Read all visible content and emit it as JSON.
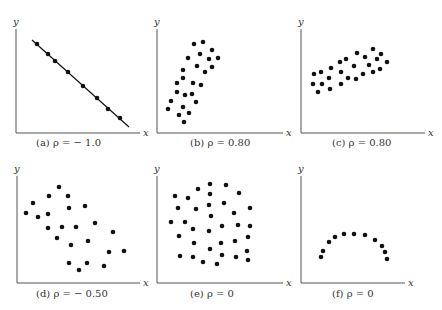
{
  "chart_data": [
    {
      "id": "a",
      "type": "scatter",
      "caption": "(a)   ρ = − 1.0",
      "xlabel": "x",
      "ylabel": "y",
      "rho": -1.0,
      "fit_line": true,
      "axes": {
        "ox": 16,
        "oy": 133,
        "ytop": 29,
        "xend": 140
      },
      "line": [
        32,
        40,
        129,
        127
      ],
      "points": [
        [
          37,
          44
        ],
        [
          48,
          54
        ],
        [
          55,
          61
        ],
        [
          68,
          72
        ],
        [
          83,
          86
        ],
        [
          97,
          98
        ],
        [
          108,
          109
        ],
        [
          120,
          118
        ]
      ],
      "caption_pos": [
        36,
        146
      ]
    },
    {
      "id": "b",
      "type": "scatter",
      "caption": "(b)   ρ = 0.80",
      "xlabel": "x",
      "ylabel": "y",
      "rho": 0.8,
      "fit_line": false,
      "axes": {
        "ox": 157,
        "oy": 133,
        "ytop": 29,
        "xend": 283
      },
      "points": [
        [
          194,
          44
        ],
        [
          203,
          42
        ],
        [
          212,
          50
        ],
        [
          200,
          54
        ],
        [
          188,
          58
        ],
        [
          209,
          59
        ],
        [
          218,
          58
        ],
        [
          212,
          67
        ],
        [
          197,
          66
        ],
        [
          183,
          70
        ],
        [
          205,
          72
        ],
        [
          183,
          78
        ],
        [
          177,
          83
        ],
        [
          193,
          83
        ],
        [
          201,
          85
        ],
        [
          177,
          92
        ],
        [
          185,
          95
        ],
        [
          192,
          94
        ],
        [
          171,
          101
        ],
        [
          196,
          102
        ],
        [
          183,
          107
        ],
        [
          168,
          109
        ],
        [
          189,
          113
        ],
        [
          179,
          115
        ],
        [
          184,
          122
        ]
      ],
      "caption_pos": [
        190,
        146
      ]
    },
    {
      "id": "c",
      "type": "scatter",
      "caption": "(c)   ρ = 0.80",
      "xlabel": "x",
      "ylabel": "y",
      "rho": 0.8,
      "fit_line": false,
      "axes": {
        "ox": 301,
        "oy": 133,
        "ytop": 29,
        "xend": 425
      },
      "points": [
        [
          373,
          49
        ],
        [
          381,
          54
        ],
        [
          357,
          53
        ],
        [
          365,
          57
        ],
        [
          377,
          59
        ],
        [
          387,
          62
        ],
        [
          346,
          59
        ],
        [
          340,
          62
        ],
        [
          354,
          66
        ],
        [
          369,
          65
        ],
        [
          380,
          69
        ],
        [
          373,
          72
        ],
        [
          331,
          68
        ],
        [
          321,
          72
        ],
        [
          314,
          74
        ],
        [
          341,
          72
        ],
        [
          329,
          78
        ],
        [
          348,
          78
        ],
        [
          356,
          79
        ],
        [
          363,
          74
        ],
        [
          313,
          84
        ],
        [
          322,
          84
        ],
        [
          341,
          84
        ],
        [
          330,
          89
        ],
        [
          318,
          92
        ]
      ],
      "caption_pos": [
        332,
        146
      ]
    },
    {
      "id": "d",
      "type": "scatter",
      "caption": "(d)   ρ = − 0.50",
      "xlabel": "x",
      "ylabel": "y",
      "rho": -0.5,
      "fit_line": false,
      "axes": {
        "ox": 17,
        "oy": 283,
        "ytop": 176,
        "xend": 140
      },
      "points": [
        [
          59,
          187
        ],
        [
          49,
          196
        ],
        [
          68,
          196
        ],
        [
          33,
          203
        ],
        [
          69,
          208
        ],
        [
          85,
          206
        ],
        [
          26,
          213
        ],
        [
          38,
          217
        ],
        [
          48,
          214
        ],
        [
          48,
          228
        ],
        [
          62,
          227
        ],
        [
          76,
          227
        ],
        [
          95,
          223
        ],
        [
          113,
          232
        ],
        [
          57,
          238
        ],
        [
          71,
          245
        ],
        [
          88,
          241
        ],
        [
          109,
          252
        ],
        [
          124,
          251
        ],
        [
          69,
          263
        ],
        [
          87,
          263
        ],
        [
          104,
          266
        ],
        [
          79,
          270
        ]
      ],
      "caption_pos": [
        36,
        297
      ]
    },
    {
      "id": "e",
      "type": "scatter",
      "caption": "(e)   ρ = 0",
      "xlabel": "x",
      "ylabel": "y",
      "rho": 0,
      "fit_line": false,
      "axes": {
        "ox": 157,
        "oy": 283,
        "ytop": 176,
        "xend": 283
      },
      "points": [
        [
          210,
          184
        ],
        [
          226,
          185
        ],
        [
          198,
          189
        ],
        [
          210,
          194
        ],
        [
          239,
          193
        ],
        [
          175,
          196
        ],
        [
          188,
          198
        ],
        [
          209,
          205
        ],
        [
          224,
          203
        ],
        [
          178,
          208
        ],
        [
          196,
          209
        ],
        [
          250,
          208
        ],
        [
          234,
          213
        ],
        [
          211,
          216
        ],
        [
          171,
          222
        ],
        [
          185,
          222
        ],
        [
          193,
          229
        ],
        [
          209,
          231
        ],
        [
          222,
          226
        ],
        [
          238,
          225
        ],
        [
          250,
          226
        ],
        [
          179,
          236
        ],
        [
          248,
          237
        ],
        [
          194,
          243
        ],
        [
          221,
          243
        ],
        [
          235,
          241
        ],
        [
          210,
          249
        ],
        [
          247,
          251
        ],
        [
          222,
          255
        ],
        [
          180,
          256
        ],
        [
          193,
          257
        ],
        [
          236,
          257
        ],
        [
          203,
          262
        ],
        [
          217,
          264
        ],
        [
          248,
          260
        ]
      ],
      "caption_pos": [
        190,
        297
      ]
    },
    {
      "id": "f",
      "type": "scatter",
      "caption": "(f)   ρ = 0",
      "xlabel": "x",
      "ylabel": "y",
      "rho": 0,
      "fit_line": false,
      "axes": {
        "ox": 301,
        "oy": 283,
        "ytop": 176,
        "xend": 405
      },
      "points": [
        [
          321,
          257
        ],
        [
          323,
          251
        ],
        [
          329,
          242
        ],
        [
          335,
          237
        ],
        [
          344,
          234
        ],
        [
          354,
          234
        ],
        [
          365,
          235
        ],
        [
          375,
          240
        ],
        [
          382,
          246
        ],
        [
          385,
          252
        ],
        [
          387,
          259
        ]
      ],
      "caption_pos": [
        332,
        297
      ]
    }
  ]
}
